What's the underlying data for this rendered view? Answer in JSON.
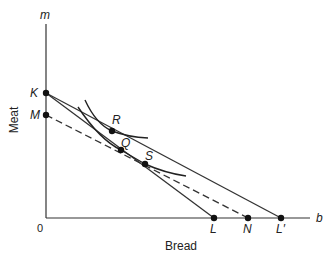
{
  "diagram": {
    "type": "indifference-curve-budget-line",
    "axes": {
      "x": {
        "symbol": "b",
        "title": "Bread"
      },
      "y": {
        "symbol": "m",
        "title": "Meat"
      },
      "origin_label": "0"
    },
    "points": {
      "K": {
        "label": "K",
        "x": 46,
        "y": 93
      },
      "M": {
        "label": "M",
        "x": 46,
        "y": 115
      },
      "R": {
        "label": "R",
        "x": 112,
        "y": 131
      },
      "Q": {
        "label": "Q",
        "x": 121,
        "y": 150
      },
      "S": {
        "label": "S",
        "x": 145,
        "y": 164
      },
      "L": {
        "label": "L",
        "x": 214,
        "y": 218
      },
      "N": {
        "label": "N",
        "x": 248,
        "y": 218
      },
      "Lp": {
        "label": "L′",
        "x": 281,
        "y": 218
      }
    },
    "lines": [
      {
        "name": "budget-line-KL",
        "from": "K",
        "to": "L",
        "style": "solid"
      },
      {
        "name": "budget-line-KLprime",
        "from": "K",
        "to": "Lp",
        "style": "solid"
      },
      {
        "name": "compensated-budget-line-MN",
        "from": "M",
        "to": "N",
        "style": "dashed"
      }
    ],
    "curves": [
      {
        "name": "indifference-curve-upper",
        "through": [
          "R"
        ]
      },
      {
        "name": "indifference-curve-lower",
        "through": [
          "Q",
          "S"
        ]
      }
    ],
    "colors": {
      "ink": "#222222",
      "background": "#ffffff"
    }
  }
}
